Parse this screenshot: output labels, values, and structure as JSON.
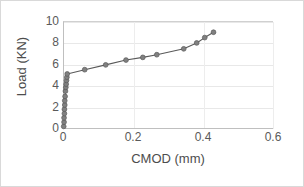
{
  "chart_data": {
    "type": "line",
    "title": "",
    "xlabel": "CMOD (mm)",
    "ylabel": "Load (KN)",
    "xlim": [
      0,
      0.6
    ],
    "ylim": [
      0,
      10
    ],
    "xticks": [
      "0",
      "0.2",
      "0.4",
      "0.6"
    ],
    "xtick_values": [
      0,
      0.2,
      0.4,
      0.6
    ],
    "yticks": [
      "0",
      "2",
      "4",
      "6",
      "8",
      "10"
    ],
    "ytick_values": [
      0,
      2,
      4,
      6,
      8,
      10
    ],
    "grid": "horizontal-and-vertical",
    "legend": "none",
    "marker": "circle",
    "series": [
      {
        "name": "Load vs CMOD",
        "color": "#808080",
        "line_color": "#595959",
        "x": [
          0.002,
          0.003,
          0.003,
          0.004,
          0.004,
          0.005,
          0.005,
          0.006,
          0.007,
          0.008,
          0.009,
          0.01,
          0.011,
          0.012,
          0.062,
          0.122,
          0.18,
          0.228,
          0.268,
          0.345,
          0.382,
          0.405,
          0.43
        ],
        "y": [
          0.15,
          0.55,
          0.95,
          1.35,
          1.75,
          2.15,
          2.55,
          2.95,
          3.45,
          3.8,
          4.1,
          4.45,
          4.75,
          5.05,
          5.45,
          5.9,
          6.35,
          6.6,
          6.85,
          7.4,
          7.95,
          8.45,
          8.95
        ]
      }
    ]
  },
  "axis": {
    "x_title": "CMOD (mm)",
    "y_title": "Load (KN)"
  }
}
